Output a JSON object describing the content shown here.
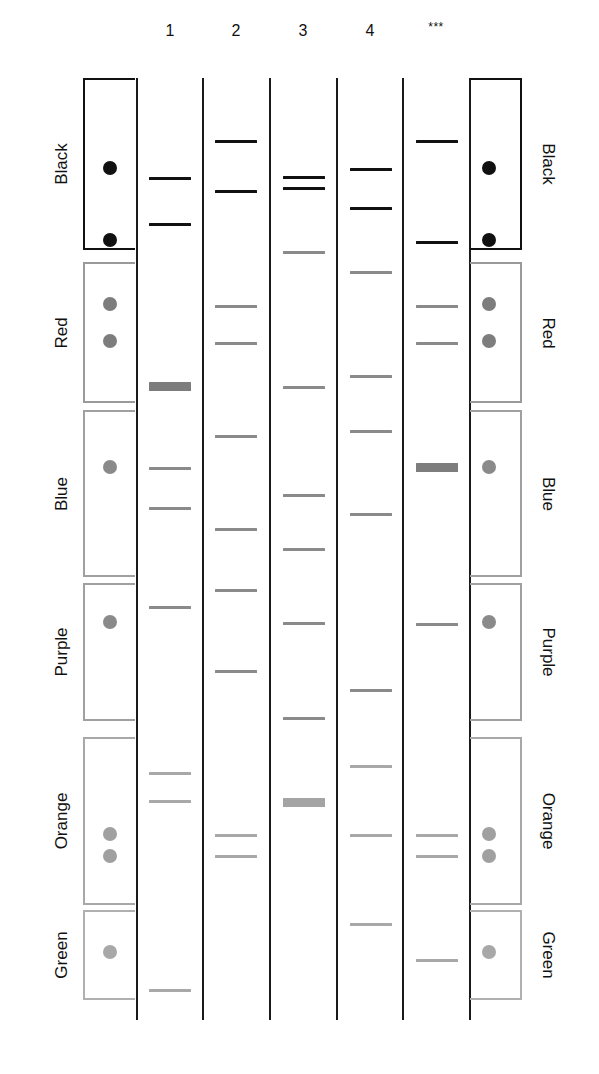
{
  "diagram": {
    "type": "gel-electrophoresis-schematic",
    "lane_headers": [
      {
        "id": "lane-1",
        "label": "1",
        "x": 170
      },
      {
        "id": "lane-2",
        "label": "2",
        "x": 236
      },
      {
        "id": "lane-3",
        "label": "3",
        "x": 303
      },
      {
        "id": "lane-4",
        "label": "4",
        "x": 370
      },
      {
        "id": "lane-unknown",
        "label": "***",
        "x": 436
      }
    ],
    "dividers_x": [
      137,
      203,
      270,
      337,
      403,
      470
    ],
    "categories": [
      {
        "name": "Black",
        "top": 78,
        "bottom": 250,
        "color": "#111111",
        "border": "#111111",
        "dots_y": [
          168,
          240
        ]
      },
      {
        "name": "Red",
        "top": 262,
        "bottom": 403,
        "color": "#7d7d7d",
        "border": "#9a9a9a",
        "dots_y": [
          304,
          341
        ]
      },
      {
        "name": "Blue",
        "top": 410,
        "bottom": 577,
        "color": "#8a8a8a",
        "border": "#a0a0a0",
        "dots_y": [
          467
        ]
      },
      {
        "name": "Purple",
        "top": 583,
        "bottom": 721,
        "color": "#8a8a8a",
        "border": "#a0a0a0",
        "dots_y": [
          622
        ]
      },
      {
        "name": "Orange",
        "top": 737,
        "bottom": 905,
        "color": "#a0a0a0",
        "border": "#a8a8a8",
        "dots_y": [
          834,
          856
        ]
      },
      {
        "name": "Green",
        "top": 910,
        "bottom": 1000,
        "color": "#a8a8a8",
        "border": "#b0b0b0",
        "dots_y": [
          952
        ]
      }
    ],
    "lanes": [
      {
        "label": "1",
        "x0": 149,
        "bands": [
          {
            "y": 177,
            "style": "dark"
          },
          {
            "y": 223,
            "style": "dark"
          },
          {
            "y": 382,
            "style": "thick-mid"
          },
          {
            "y": 467,
            "style": "mid"
          },
          {
            "y": 507,
            "style": "mid"
          },
          {
            "y": 606,
            "style": "mid"
          },
          {
            "y": 772,
            "style": "light"
          },
          {
            "y": 800,
            "style": "light"
          },
          {
            "y": 989,
            "style": "light"
          }
        ]
      },
      {
        "label": "2",
        "x0": 215,
        "bands": [
          {
            "y": 140,
            "style": "dark"
          },
          {
            "y": 190,
            "style": "dark"
          },
          {
            "y": 305,
            "style": "mid"
          },
          {
            "y": 342,
            "style": "mid"
          },
          {
            "y": 435,
            "style": "mid"
          },
          {
            "y": 528,
            "style": "mid"
          },
          {
            "y": 589,
            "style": "mid"
          },
          {
            "y": 670,
            "style": "mid"
          },
          {
            "y": 834,
            "style": "light"
          },
          {
            "y": 855,
            "style": "light"
          }
        ]
      },
      {
        "label": "3",
        "x0": 283,
        "bands": [
          {
            "y": 176,
            "style": "dark"
          },
          {
            "y": 187,
            "style": "dark"
          },
          {
            "y": 251,
            "style": "mid"
          },
          {
            "y": 386,
            "style": "mid"
          },
          {
            "y": 494,
            "style": "mid"
          },
          {
            "y": 548,
            "style": "mid"
          },
          {
            "y": 622,
            "style": "mid"
          },
          {
            "y": 717,
            "style": "mid"
          },
          {
            "y": 798,
            "style": "thick-light"
          }
        ]
      },
      {
        "label": "4",
        "x0": 350,
        "bands": [
          {
            "y": 168,
            "style": "dark"
          },
          {
            "y": 207,
            "style": "dark"
          },
          {
            "y": 271,
            "style": "mid"
          },
          {
            "y": 375,
            "style": "mid"
          },
          {
            "y": 430,
            "style": "mid"
          },
          {
            "y": 513,
            "style": "mid"
          },
          {
            "y": 689,
            "style": "mid"
          },
          {
            "y": 765,
            "style": "light"
          },
          {
            "y": 834,
            "style": "light"
          },
          {
            "y": 923,
            "style": "light"
          }
        ]
      },
      {
        "label": "***",
        "x0": 416,
        "bands": [
          {
            "y": 140,
            "style": "dark"
          },
          {
            "y": 241,
            "style": "dark"
          },
          {
            "y": 305,
            "style": "mid"
          },
          {
            "y": 342,
            "style": "mid"
          },
          {
            "y": 463,
            "style": "thick-mid"
          },
          {
            "y": 623,
            "style": "mid"
          },
          {
            "y": 834,
            "style": "light"
          },
          {
            "y": 855,
            "style": "light"
          },
          {
            "y": 959,
            "style": "light"
          }
        ]
      }
    ],
    "band_width": 42
  }
}
